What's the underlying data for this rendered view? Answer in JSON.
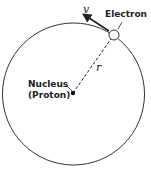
{
  "diagram": {
    "labels": {
      "electron": "Electron",
      "nucleus_line1": "Nucleus",
      "nucleus_line2": "(Proton)",
      "velocity": "v",
      "radius": "r"
    },
    "colors": {
      "stroke": "#333333",
      "background": "#ffffff"
    }
  }
}
